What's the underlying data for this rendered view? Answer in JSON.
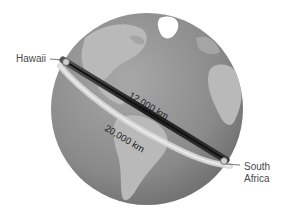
{
  "diagram": {
    "locations": [
      {
        "name": "Hawaii"
      },
      {
        "name": "South Africa"
      }
    ],
    "paths": [
      {
        "id": "great-circle",
        "label": "12,000 km",
        "color": "#2a2a2a"
      },
      {
        "id": "longer-route",
        "label": "20,000 km",
        "color": "#d8d8d8"
      }
    ],
    "colors": {
      "ocean": "#8c8c8c",
      "land": "#b9b9b9",
      "ice": "#ffffff",
      "background": "#ffffff"
    }
  },
  "labels": {
    "hawaii": "Hawaii",
    "south_africa_line1": "South",
    "south_africa_line2": "Africa",
    "path_short": "12,000 km",
    "path_long": "20,000 km"
  }
}
